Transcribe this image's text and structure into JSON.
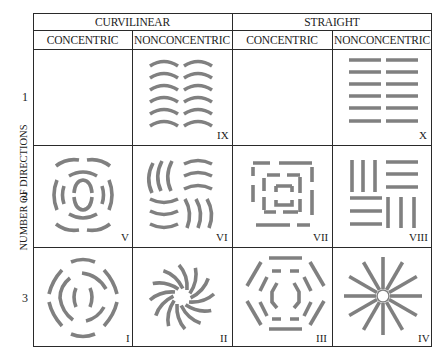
{
  "header": {
    "groups": [
      {
        "label": "CURVILINEAR"
      },
      {
        "label": "STRAIGHT"
      }
    ],
    "columns": [
      {
        "label": "CONCENTRIC"
      },
      {
        "label": "NONCONCENTRIC"
      },
      {
        "label": "CONCENTRIC"
      },
      {
        "label": "NONCONCENTRIC"
      }
    ]
  },
  "y_axis": {
    "label": "NUMBER OF DIRECTIONS",
    "rows": [
      {
        "label": "1"
      },
      {
        "label": "2"
      },
      {
        "label": "3"
      }
    ]
  },
  "cells": [
    {
      "row": "1",
      "col": "curvilinear-concentric",
      "numeral": "",
      "pattern": "empty"
    },
    {
      "row": "1",
      "col": "curvilinear-nonconcentric",
      "numeral": "IX",
      "pattern": "parallel-arcs"
    },
    {
      "row": "1",
      "col": "straight-concentric",
      "numeral": "",
      "pattern": "empty"
    },
    {
      "row": "1",
      "col": "straight-nonconcentric",
      "numeral": "X",
      "pattern": "parallel-bars"
    },
    {
      "row": "2",
      "col": "curvilinear-concentric",
      "numeral": "V",
      "pattern": "concentric-arcs-2dir"
    },
    {
      "row": "2",
      "col": "curvilinear-nonconcentric",
      "numeral": "VI",
      "pattern": "basketweave-arcs"
    },
    {
      "row": "2",
      "col": "straight-concentric",
      "numeral": "VII",
      "pattern": "concentric-squares"
    },
    {
      "row": "2",
      "col": "straight-nonconcentric",
      "numeral": "VIII",
      "pattern": "basketweave-bars"
    },
    {
      "row": "3",
      "col": "curvilinear-concentric",
      "numeral": "I",
      "pattern": "concentric-circles"
    },
    {
      "row": "3",
      "col": "curvilinear-nonconcentric",
      "numeral": "II",
      "pattern": "curved-radial"
    },
    {
      "row": "3",
      "col": "straight-concentric",
      "numeral": "III",
      "pattern": "concentric-hexagons"
    },
    {
      "row": "3",
      "col": "straight-nonconcentric",
      "numeral": "IV",
      "pattern": "radial-spokes"
    }
  ],
  "colors": {
    "stroke": "#808080",
    "grid": "#2a2a2a"
  }
}
